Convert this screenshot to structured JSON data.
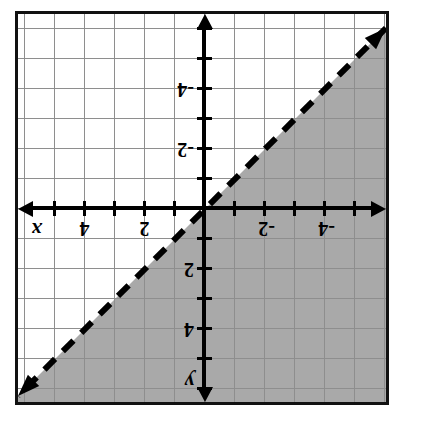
{
  "figure": {
    "orientation_degrees": 180,
    "axis_labels": {
      "x": "x",
      "y": "y"
    },
    "colors": {
      "shading": "#a9a9a9",
      "grid": "#8e8e8e",
      "axis": "#000000",
      "border": "#111111",
      "background": "#ffffff"
    }
  },
  "chart_data": {
    "type": "line",
    "title": "",
    "xlabel": "x",
    "ylabel": "y",
    "xlim": [
      -6,
      6
    ],
    "ylim": [
      -6.5,
      6.5
    ],
    "grid": true,
    "legend": "none",
    "grid_step": 1,
    "tick_step": 1,
    "label_step": 2,
    "x_tick_labels": [
      "-4",
      "-2",
      "2",
      "4"
    ],
    "y_tick_labels": [
      "-4",
      "-2",
      "2",
      "4"
    ],
    "x_tick_values": [
      -4,
      -2,
      2,
      4
    ],
    "y_tick_values": [
      -4,
      -2,
      2,
      4
    ],
    "series": [
      {
        "name": "boundary line",
        "equation": "y = x",
        "slope": 1,
        "intercept": 0,
        "style": "dashed",
        "strict": true,
        "arrows": [
          "both"
        ],
        "x": [
          -6,
          6
        ],
        "values": [
          -6,
          6
        ]
      }
    ],
    "shaded_region": {
      "inequality": "y > x",
      "side": "above-left",
      "color": "#a9a9a9",
      "boundary_included": false
    },
    "annotations": []
  },
  "ticks": {
    "x_right": [
      {
        "label": "-2",
        "value": -2
      },
      {
        "label": "-4",
        "value": -4
      }
    ],
    "x_left": [
      {
        "label": "4",
        "value": 4
      },
      {
        "label": "2",
        "value": 2
      }
    ],
    "y_top": [
      {
        "label": "-4",
        "value": -4
      },
      {
        "label": "-2",
        "value": -2
      }
    ],
    "y_bottom": [
      {
        "label": "2",
        "value": 2
      },
      {
        "label": "4",
        "value": 4
      }
    ]
  }
}
